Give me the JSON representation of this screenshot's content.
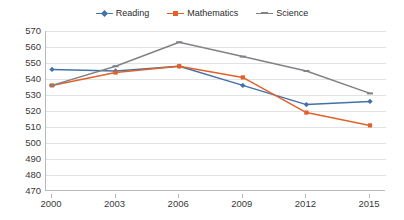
{
  "chart_data": {
    "type": "line",
    "title": "",
    "xlabel": "",
    "ylabel": "",
    "categories": [
      "2000",
      "2003",
      "2006",
      "2009",
      "2012",
      "2015"
    ],
    "x": [
      2000,
      2003,
      2006,
      2009,
      2012,
      2015
    ],
    "ylim": [
      470,
      570
    ],
    "yticks": [
      470,
      480,
      490,
      500,
      510,
      520,
      530,
      540,
      550,
      560,
      570
    ],
    "grid": true,
    "legend_position": "top-center",
    "series": [
      {
        "name": "Reading",
        "color": "#4472a8",
        "marker": "diamond",
        "values": [
          546,
          545,
          548,
          536,
          524,
          526
        ]
      },
      {
        "name": "Mathematics",
        "color": "#e0622a",
        "marker": "square",
        "values": [
          536,
          544,
          548,
          541,
          519,
          511
        ]
      },
      {
        "name": "Science",
        "color": "#808286",
        "marker": "dash",
        "values": [
          536,
          548,
          563,
          554,
          545,
          531
        ]
      }
    ]
  },
  "legend": {
    "entries": [
      {
        "label": "Reading"
      },
      {
        "label": "Mathematics"
      },
      {
        "label": "Science"
      }
    ]
  }
}
